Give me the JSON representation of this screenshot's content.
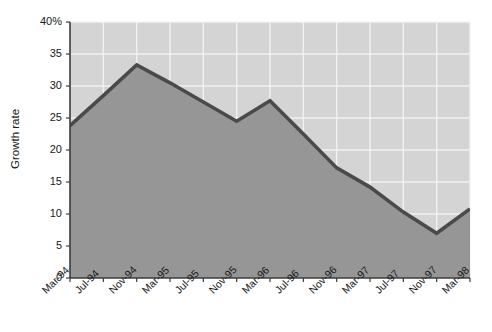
{
  "chart_data": {
    "type": "area",
    "title": "",
    "subtitle": "",
    "xlabel": "",
    "ylabel": "Growth rate",
    "categories": [
      "Mar-94",
      "Jul-94",
      "Nov-94",
      "Mar-95",
      "Jul-95",
      "Nov-95",
      "Mar-96",
      "Jul-96",
      "Nov-96",
      "Mar-97",
      "Jul-97",
      "Nov-97",
      "Mar-98"
    ],
    "values": [
      23.8,
      28.5,
      33.3,
      30.5,
      27.5,
      24.5,
      27.7,
      22.5,
      17.2,
      14.2,
      10.3,
      7.0,
      10.8
    ],
    "ylim": [
      0,
      40
    ],
    "yticks": [
      0,
      5,
      10,
      15,
      20,
      25,
      30,
      35,
      40
    ],
    "ytick_labels": [
      "0",
      "5",
      "10",
      "15",
      "20",
      "25",
      "30",
      "35",
      "40%"
    ],
    "grid": true,
    "grid_axes": "both",
    "legend": "none",
    "annotations": [],
    "colors": {
      "plot_background": "#d4d4d4",
      "area_fill": "#969696",
      "line": "#4a4a4a",
      "gridline": "#f2f2f2",
      "axis": "#3c3c3c",
      "text": "#1a1a1a",
      "page_background": "#ffffff"
    }
  }
}
